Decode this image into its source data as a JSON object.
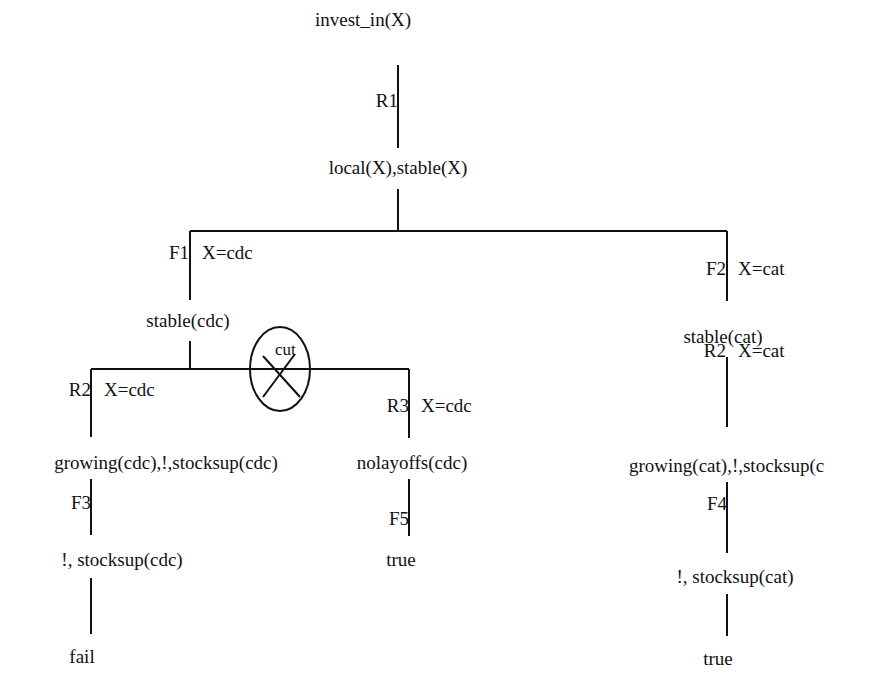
{
  "diagram": {
    "colors": {
      "line": "#111111",
      "background": "#ffffff"
    },
    "nodes": {
      "root": "invest_in(X)",
      "n1": "local(X),stable(X)",
      "n_left": "stable(cdc)",
      "n_right": "stable(cat)",
      "n_ll": "growing(cdc),!,stocksup(cdc)",
      "n_lr": "nolayoffs(cdc)",
      "n_rr": "growing(cat),!,stocksup(c",
      "n_ll2": "!, stocksup(cdc)",
      "n_lr2": "true",
      "n_rr2": "!, stocksup(cat)",
      "n_ll3": "fail",
      "n_rr3": "true"
    },
    "edges": {
      "r1": {
        "rule": "R1",
        "binding": ""
      },
      "f1": {
        "rule": "F1",
        "binding": "X=cdc"
      },
      "f2": {
        "rule": "F2",
        "binding": "X=cat"
      },
      "r2_left": {
        "rule": "R2",
        "binding": "X=cdc"
      },
      "r3": {
        "rule": "R3",
        "binding": "X=cdc"
      },
      "r2_right": {
        "rule": "R2",
        "binding": "X=cat"
      },
      "f3": {
        "rule": "F3",
        "binding": ""
      },
      "f5": {
        "rule": "F5",
        "binding": ""
      },
      "f4": {
        "rule": "F4",
        "binding": ""
      }
    },
    "cut_marker": {
      "label": "cut",
      "icon": "cut-cross-icon"
    }
  }
}
